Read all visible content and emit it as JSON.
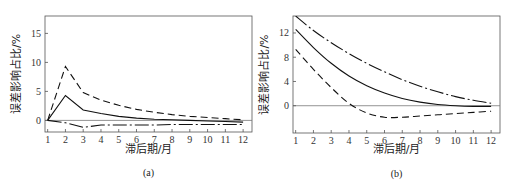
{
  "chart_data": [
    {
      "type": "line",
      "panel_label": "(a)",
      "xlabel": "滞后期/月",
      "ylabel": "误差影响占比/%",
      "x": [
        1,
        2,
        3,
        4,
        5,
        6,
        7,
        8,
        9,
        10,
        11,
        12
      ],
      "xticks": [
        "1",
        "2",
        "3",
        "4",
        "5",
        "6",
        "7",
        "8",
        "9",
        "10",
        "11",
        "12"
      ],
      "yticks": [
        "0",
        "5",
        "10",
        "15"
      ],
      "ylim": [
        -2,
        18
      ],
      "xlim": [
        0.85,
        12.5
      ],
      "zero_line": true,
      "series": [
        {
          "name": "upper-bound",
          "style": "dashed",
          "values": [
            0,
            9.3,
            4.8,
            3.5,
            2.6,
            1.9,
            1.4,
            1.0,
            0.7,
            0.5,
            0.3,
            0.1
          ]
        },
        {
          "name": "estimate",
          "style": "solid",
          "values": [
            0,
            4.3,
            1.8,
            1.2,
            0.7,
            0.4,
            0.2,
            0.1,
            0.0,
            -0.1,
            -0.2,
            -0.3
          ]
        },
        {
          "name": "lower-bound",
          "style": "dash-dot",
          "values": [
            0,
            -0.4,
            -1.2,
            -0.8,
            -0.8,
            -0.8,
            -0.8,
            -0.7,
            -0.7,
            -0.7,
            -0.7,
            -0.7
          ]
        }
      ]
    },
    {
      "type": "line",
      "panel_label": "(b)",
      "xlabel": "滞后期/月",
      "ylabel": "误差影响占比/%",
      "x": [
        1,
        2,
        3,
        4,
        5,
        6,
        7,
        8,
        9,
        10,
        11,
        12
      ],
      "xticks": [
        "1",
        "2",
        "3",
        "4",
        "5",
        "6",
        "7",
        "8",
        "9",
        "10",
        "11",
        "12"
      ],
      "yticks": [
        "0",
        "4",
        "8",
        "12"
      ],
      "ylim": [
        -4.5,
        14.8
      ],
      "xlim": [
        0.85,
        12.5
      ],
      "zero_line": true,
      "series": [
        {
          "name": "upper-bound",
          "style": "dash-dot",
          "values": [
            14.8,
            12.4,
            10.4,
            8.6,
            7.0,
            5.6,
            4.3,
            3.2,
            2.3,
            1.5,
            0.9,
            0.4
          ]
        },
        {
          "name": "estimate",
          "style": "solid",
          "values": [
            12.6,
            9.6,
            7.0,
            4.9,
            3.3,
            2.1,
            1.2,
            0.6,
            0.2,
            0.0,
            -0.1,
            -0.1
          ]
        },
        {
          "name": "lower-bound",
          "style": "dashed",
          "values": [
            9.3,
            6.0,
            3.0,
            0.4,
            -1.2,
            -1.9,
            -1.9,
            -1.7,
            -1.5,
            -1.3,
            -1.1,
            -0.9
          ]
        }
      ]
    }
  ]
}
